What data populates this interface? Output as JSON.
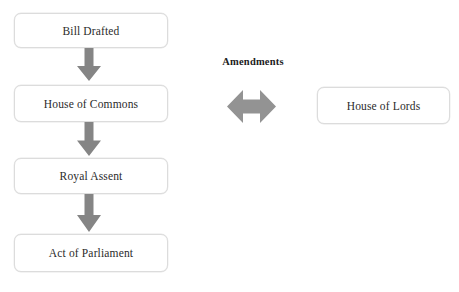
{
  "diagram": {
    "title_strip": "",
    "background_color": "#ffffff",
    "arrow_color": "#858585",
    "box_border_color": "#dcdcdc",
    "text_color": "#2b2b2b",
    "nodes": [
      {
        "id": "bill",
        "label": "Bill Drafted"
      },
      {
        "id": "commons",
        "label": "House of Commons"
      },
      {
        "id": "royal_assent",
        "label": "Royal Assent"
      },
      {
        "id": "act",
        "label": "Act of Parliament"
      },
      {
        "id": "lords",
        "label": "House of Lords"
      }
    ],
    "connectors": [
      {
        "id": "arrow_1",
        "from": "bill",
        "to": "commons",
        "direction": "down",
        "style": "block-arrow"
      },
      {
        "id": "arrow_2",
        "from": "commons",
        "to": "royal_assent",
        "direction": "down",
        "style": "block-arrow"
      },
      {
        "id": "arrow_3",
        "from": "royal_assent",
        "to": "act",
        "direction": "down",
        "style": "block-arrow"
      },
      {
        "id": "arrow_amendments",
        "from": "commons",
        "to": "lords",
        "direction": "bidirectional",
        "style": "block-arrow",
        "label": "Amendments"
      }
    ],
    "labels": {
      "amendments": "Amendments"
    }
  }
}
